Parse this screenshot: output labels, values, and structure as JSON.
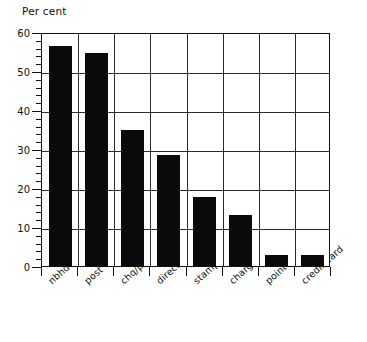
{
  "chart_data": {
    "type": "bar",
    "title": "",
    "subtitle": "",
    "xlabel": "",
    "ylabel": "Per cent",
    "ylim": [
      0,
      60
    ],
    "ytick_step": 10,
    "yminor_step": 2,
    "grid": "both",
    "legend": "none",
    "orientation": "vertical",
    "bar_color": "#0a0a0a",
    "categories": [
      "nbhd office",
      "post office",
      "chq/post",
      "direct debit",
      "stamps",
      "charge card",
      "point of service",
      "credit card"
    ],
    "values": [
      56.5,
      54.7,
      34.8,
      28.5,
      17.7,
      13.0,
      2.7,
      2.7
    ],
    "ytick_labels": [
      "0",
      "10",
      "20",
      "30",
      "40",
      "50",
      "60"
    ],
    "ytick_values": [
      0,
      10,
      20,
      30,
      40,
      50,
      60
    ]
  }
}
